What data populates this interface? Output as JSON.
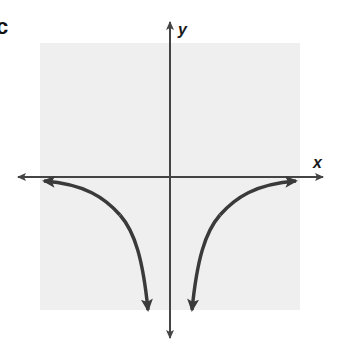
{
  "panel": {
    "label": "c"
  },
  "graph": {
    "x_axis_label": "x",
    "y_axis_label": "y",
    "background_color": "#efefef",
    "axis_color": "#444444",
    "curve_color": "#3a3a3a",
    "description": "Graph of a function with vertical asymptote at x=0 and horizontal asymptote y=0; both branches below the x-axis, approaching the x-axis at far left/right and descending toward negative infinity near the y-axis (e.g. y = -1/x^2)."
  }
}
